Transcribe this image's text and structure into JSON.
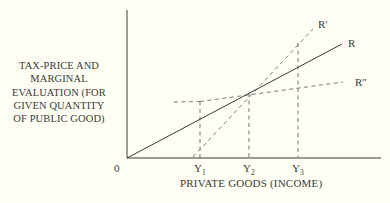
{
  "diagram": {
    "y_axis_label": [
      "TAX-PRICE AND",
      "MARGINAL",
      "EVALUATION (FOR",
      "GIVEN QUANTITY",
      "OF PUBLIC GOOD)"
    ],
    "x_axis_label": "PRIVATE GOODS (INCOME)",
    "origin_label": "0",
    "ticks": {
      "y1": {
        "base": "Y",
        "sub": "1"
      },
      "y2": {
        "base": "Y",
        "sub": "2"
      },
      "y3": {
        "base": "Y",
        "sub": "3"
      }
    },
    "curves": {
      "r": "R",
      "r_prime": "R′",
      "r_double_prime": "R″"
    },
    "colors": {
      "background": "#fefef4",
      "ink": "#3a3a3a",
      "dashed": "#6a6a6a"
    }
  }
}
